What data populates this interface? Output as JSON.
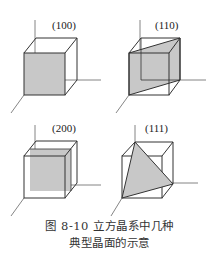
{
  "figure": {
    "panels": [
      {
        "label": "(100)",
        "plane": "face"
      },
      {
        "label": "(110)",
        "plane": "diagonal"
      },
      {
        "label": "(200)",
        "plane": "half-face"
      },
      {
        "label": "(111)",
        "plane": "triangle"
      }
    ],
    "caption_line1": "图 8-10   立方晶系中几种",
    "caption_line2": "典型晶面的示意",
    "colors": {
      "plane_fill": "#c8c8c8",
      "edge": "#333333",
      "axis": "#666666"
    }
  }
}
